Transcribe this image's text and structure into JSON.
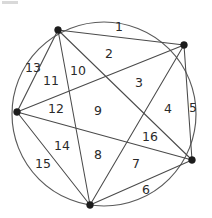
{
  "figure": {
    "canvas": {
      "width": 212,
      "height": 218
    },
    "colors": {
      "background": "#ffffff",
      "circle_stroke": "#5a5a5a",
      "chord_stroke": "#4a4a4a",
      "vertex_fill": "#1c1c1c",
      "label_fill": "#2a2a2a"
    },
    "circle": {
      "cx": 104,
      "cy": 114,
      "r": 92
    },
    "vertices": [
      {
        "id": "v1",
        "name": "top-left-vertex",
        "x": 58,
        "y": 30,
        "r": 3.4
      },
      {
        "id": "v2",
        "name": "top-right-vertex",
        "x": 184,
        "y": 45,
        "r": 3.4
      },
      {
        "id": "v3",
        "name": "right-lower-vertex",
        "x": 192,
        "y": 160,
        "r": 3.4
      },
      {
        "id": "v4",
        "name": "bottom-vertex",
        "x": 90,
        "y": 205,
        "r": 3.4
      },
      {
        "id": "v5",
        "name": "left-vertex",
        "x": 17,
        "y": 112,
        "r": 3.4
      }
    ],
    "chords": [
      {
        "id": "c12",
        "from": "v1",
        "to": "v2"
      },
      {
        "id": "c13",
        "from": "v1",
        "to": "v3"
      },
      {
        "id": "c14",
        "from": "v1",
        "to": "v4"
      },
      {
        "id": "c15",
        "from": "v1",
        "to": "v5"
      },
      {
        "id": "c23",
        "from": "v2",
        "to": "v3"
      },
      {
        "id": "c24",
        "from": "v2",
        "to": "v4"
      },
      {
        "id": "c25",
        "from": "v2",
        "to": "v5"
      },
      {
        "id": "c34",
        "from": "v3",
        "to": "v4"
      },
      {
        "id": "c35",
        "from": "v3",
        "to": "v5"
      },
      {
        "id": "c45",
        "from": "v4",
        "to": "v5"
      }
    ],
    "region_count": 16,
    "regions": [
      {
        "id": "r1",
        "label": "1",
        "x": 119,
        "y": 26
      },
      {
        "id": "r2",
        "label": "2",
        "x": 109,
        "y": 53
      },
      {
        "id": "r3",
        "label": "3",
        "x": 139,
        "y": 82
      },
      {
        "id": "r4",
        "label": "4",
        "x": 168,
        "y": 108
      },
      {
        "id": "r5",
        "label": "5",
        "x": 193,
        "y": 107
      },
      {
        "id": "r6",
        "label": "6",
        "x": 146,
        "y": 189
      },
      {
        "id": "r7",
        "label": "7",
        "x": 136,
        "y": 163
      },
      {
        "id": "r8",
        "label": "8",
        "x": 98,
        "y": 154
      },
      {
        "id": "r9",
        "label": "9",
        "x": 98,
        "y": 110
      },
      {
        "id": "r10",
        "label": "10",
        "x": 78,
        "y": 70
      },
      {
        "id": "r11",
        "label": "11",
        "x": 51,
        "y": 80
      },
      {
        "id": "r12",
        "label": "12",
        "x": 56,
        "y": 108
      },
      {
        "id": "r13",
        "label": "13",
        "x": 33,
        "y": 67
      },
      {
        "id": "r14",
        "label": "14",
        "x": 62,
        "y": 145
      },
      {
        "id": "r15",
        "label": "15",
        "x": 43,
        "y": 163
      },
      {
        "id": "r16",
        "label": "16",
        "x": 150,
        "y": 136
      }
    ]
  }
}
